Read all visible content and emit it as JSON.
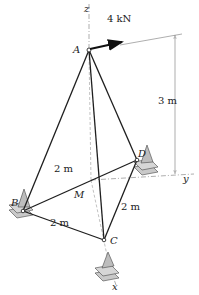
{
  "figure": {
    "points": {
      "A": "A",
      "B": "B",
      "C": "C",
      "D": "D",
      "M": "M"
    },
    "axes": {
      "x": "x",
      "y": "y",
      "z": "z"
    },
    "force": {
      "label": "4 kN"
    },
    "dimensions": {
      "height": "3 m",
      "BD": "2 m",
      "BC": "2 m",
      "CD": "2 m"
    },
    "colors": {
      "member": "#1e1e1e",
      "support": "#b8b8b8"
    }
  }
}
